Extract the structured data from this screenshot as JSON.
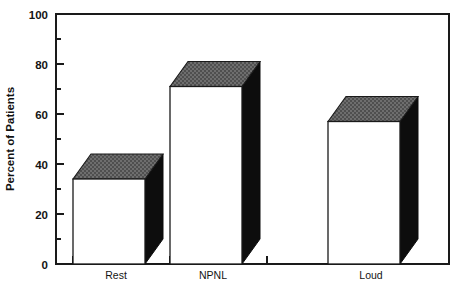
{
  "chart_data": {
    "type": "bar",
    "title": "",
    "subtitle": "",
    "xlabel": "",
    "ylabel": "Percent of Patients",
    "categories": [
      "Rest",
      "NPNL",
      "Loud"
    ],
    "values": [
      34,
      71,
      57
    ],
    "ylim": [
      0,
      100
    ],
    "yticks": [
      0,
      20,
      40,
      60,
      80,
      100
    ],
    "ytick_labels": [
      "0",
      "20",
      "40",
      "60",
      "80",
      "100"
    ],
    "yminor_ticks": [
      10,
      30,
      50,
      70,
      90
    ],
    "grid": false,
    "legend": null,
    "style": {
      "bar_style": "3d-block",
      "front_face_color": "#ffffff",
      "side_face_color": "#0d0d0d",
      "top_face_color": "#595959",
      "top_face_pattern": "checkered-dither",
      "outline_color": "#1a1a1a",
      "background_color": "#ffffff",
      "frame": "box"
    }
  },
  "axes": {
    "y_title": "Percent of Patients",
    "y_tick_0": "0",
    "y_tick_20": "20",
    "y_tick_40": "40",
    "y_tick_60": "60",
    "y_tick_80": "80",
    "y_tick_100": "100",
    "x_tick_1": "Rest",
    "x_tick_2": "NPNL",
    "x_tick_3": "Loud"
  }
}
